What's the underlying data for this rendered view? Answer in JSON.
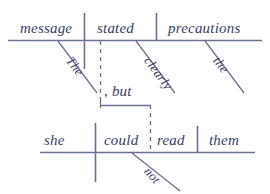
{
  "diagram": {
    "type": "reed-kellogg-sentence-diagram",
    "sentence": "The message stated clearly the precautions, but she could not read them.",
    "ink_color": "#3b3f63",
    "line_color": "#6b6f91",
    "background": "#ffffff",
    "clauses": [
      {
        "id": "main-clause",
        "subject": "message",
        "verb": "stated",
        "object": "precautions",
        "modifiers": [
          {
            "word": "The",
            "attaches_to": "message"
          },
          {
            "word": "clearly",
            "attaches_to": "stated"
          },
          {
            "word": "the",
            "attaches_to": "precautions"
          }
        ]
      },
      {
        "id": "second-clause",
        "subject": "she",
        "verb": "could read",
        "verb_parts": [
          "could",
          "read"
        ],
        "object": "them",
        "modifiers": [
          {
            "word": "not",
            "attaches_to": "could read"
          }
        ]
      }
    ],
    "conjunction": {
      "label": ", but",
      "connects": [
        "main-clause",
        "second-clause"
      ]
    }
  },
  "words": {
    "message": "message",
    "stated": "stated",
    "precautions": "precautions",
    "the_cap": "The",
    "clearly": "clearly",
    "the_lower": "the",
    "conjunction": ", but",
    "she": "she",
    "could": "could",
    "read": "read",
    "them": "them",
    "not": "not"
  }
}
